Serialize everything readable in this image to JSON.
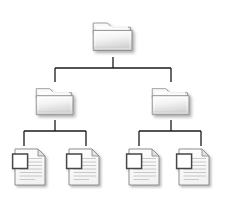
{
  "diagram": {
    "type": "tree",
    "background_color": "#ffffff",
    "connector_color": "#1a1a1a",
    "connector_width": 1.3,
    "shadow_color": "#b4b4b4",
    "folder": {
      "icon_name": "folder-icon",
      "fill_top": "#fdfdfd",
      "fill_bottom": "#d8d8d8",
      "outline": "#8c8c8c",
      "tab_fill": "#f2f2f2"
    },
    "document": {
      "icon_name": "document-icon",
      "page_fill": "#fbfbfb",
      "outline": "#8a8a8a",
      "line_color": "#b8b8b8",
      "thumbnail_outline": "#4a4a4a",
      "thumbnail_fill": "#ffffff",
      "text_line_count": 7
    },
    "levels": [
      {
        "level": 0,
        "label": "root",
        "nodes": [
          {
            "id": "root-folder",
            "name": "root-folder",
            "kind": "folder",
            "x": 113,
            "y": 36,
            "width": 46,
            "height": 38
          }
        ]
      },
      {
        "level": 1,
        "label": "subfolders",
        "nodes": [
          {
            "id": "folder-left",
            "name": "folder-left",
            "kind": "folder",
            "x": 55,
            "y": 101,
            "width": 44,
            "height": 36
          },
          {
            "id": "folder-right",
            "name": "folder-right",
            "kind": "folder",
            "x": 170,
            "y": 101,
            "width": 44,
            "height": 36
          }
        ]
      },
      {
        "level": 2,
        "label": "documents",
        "nodes": [
          {
            "id": "document-1",
            "name": "document-1",
            "kind": "document",
            "x": 30,
            "y": 167,
            "width": 38,
            "height": 44
          },
          {
            "id": "document-2",
            "name": "document-2",
            "kind": "document",
            "x": 84,
            "y": 167,
            "width": 38,
            "height": 44
          },
          {
            "id": "document-3",
            "name": "document-3",
            "kind": "document",
            "x": 144,
            "y": 167,
            "width": 38,
            "height": 44
          },
          {
            "id": "document-4",
            "name": "document-4",
            "kind": "document",
            "x": 194,
            "y": 167,
            "width": 38,
            "height": 44
          }
        ]
      }
    ],
    "connectors": [
      {
        "from": "root-folder",
        "to": "folder-left",
        "name": "connector-root-to-folder-left"
      },
      {
        "from": "root-folder",
        "to": "folder-right",
        "name": "connector-root-to-folder-right"
      },
      {
        "from": "folder-left",
        "to": "document-1",
        "name": "connector-folder-left-to-document-1"
      },
      {
        "from": "folder-left",
        "to": "document-2",
        "name": "connector-folder-left-to-document-2"
      },
      {
        "from": "folder-right",
        "to": "document-3",
        "name": "connector-folder-right-to-document-3"
      },
      {
        "from": "folder-right",
        "to": "document-4",
        "name": "connector-folder-right-to-document-4"
      }
    ],
    "watermark": ""
  }
}
